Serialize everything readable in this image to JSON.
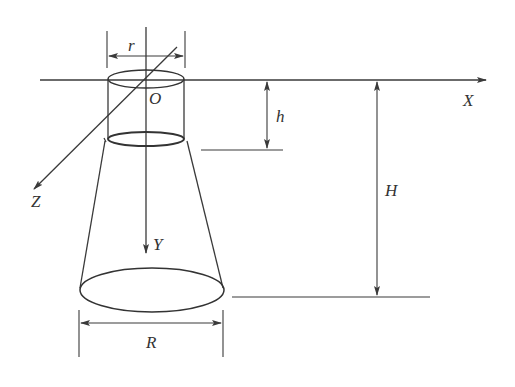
{
  "diagram": {
    "type": "technical-drawing",
    "colors": {
      "line": "#3a3a3a",
      "background": "#ffffff",
      "text": "#333333"
    },
    "axes": {
      "x": {
        "label": "X",
        "direction": "right"
      },
      "y": {
        "label": "Y",
        "direction": "down"
      },
      "z": {
        "label": "Z",
        "direction": "down-left"
      },
      "origin": {
        "label": "O"
      }
    },
    "dimensions": {
      "r": {
        "label": "r",
        "meaning": "top cylinder radius/width"
      },
      "R": {
        "label": "R",
        "meaning": "bottom cone base width"
      },
      "h": {
        "label": "h",
        "meaning": "cylinder height"
      },
      "H": {
        "label": "H",
        "meaning": "total height"
      }
    }
  }
}
